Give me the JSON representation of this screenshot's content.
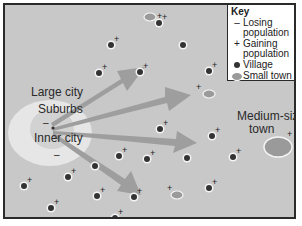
{
  "key": {
    "title": "Key",
    "items": [
      {
        "symbol": "minus",
        "glyph": "–",
        "label": "Losing population"
      },
      {
        "symbol": "plus",
        "glyph": "+",
        "label": "Gaining population"
      },
      {
        "symbol": "dot",
        "glyph": "",
        "label": "Village"
      },
      {
        "symbol": "oval",
        "glyph": "",
        "label": "Small town"
      }
    ]
  },
  "labels": {
    "large_city": "Large city",
    "suburbs": "Suburbs",
    "inner_city": "Inner city",
    "medium_town_1": "Medium-size",
    "medium_town_2": "town",
    "minus": "–",
    "plus": "+"
  },
  "colors": {
    "background": "#c8c8c8",
    "suburbs": "#e6e6e6",
    "inner_city": "#bdbdbd",
    "arrow": "#9a9a9a",
    "village": "#333333",
    "town": "#9a9a9a",
    "border": "#2a2a2a"
  },
  "diagram": {
    "city_center": [
      42,
      94
    ],
    "arrows": [
      {
        "to": [
          118,
          48
        ]
      },
      {
        "to": [
          150,
          70
        ]
      },
      {
        "to": [
          176,
          106
        ]
      },
      {
        "to": [
          128,
          158
        ]
      }
    ],
    "villages": [
      [
        105,
        39
      ],
      [
        96,
        68
      ],
      [
        178,
        38
      ],
      [
        60,
        101
      ],
      [
        91,
        104
      ],
      [
        136,
        55
      ],
      [
        158,
        60
      ],
      [
        55,
        130
      ],
      [
        67,
        144
      ],
      [
        62,
        146
      ],
      [
        107,
        172
      ],
      [
        61,
        171
      ],
      [
        95,
        183
      ],
      [
        131,
        198
      ],
      [
        17,
        180
      ],
      [
        43,
        204
      ],
      [
        148,
        205
      ],
      [
        239,
        119
      ],
      [
        234,
        150
      ],
      [
        245,
        160
      ],
      [
        203,
        176
      ],
      [
        196,
        190
      ],
      [
        65,
        171
      ]
    ],
    "small_towns": [
      [
        145,
        13
      ],
      [
        201,
        89
      ],
      [
        172,
        189
      ]
    ],
    "medium_town": [
      273,
      141
    ]
  }
}
